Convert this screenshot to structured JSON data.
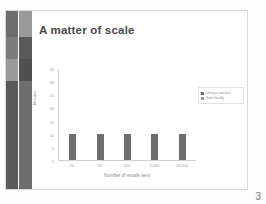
{
  "slide": {
    "title": "A matter of scale",
    "page_number": "3",
    "accent_bar_colors": [
      "#6e6e6e",
      "#7d7d7d",
      "#9a9a9a",
      "#5a5a5a",
      "#4f4f4f"
    ]
  },
  "chart_data": {
    "type": "bar",
    "title": "",
    "categories": [
      "20",
      "50",
      "100",
      "1,000",
      "10,000"
    ],
    "series": [
      {
        "name": "Using a service",
        "color": "#6d6d6d",
        "values": [
          10,
          10,
          10,
          10,
          10
        ]
      },
      {
        "name": "Sent locally",
        "color": "#9c9c9c",
        "values": [
          0,
          0,
          0,
          0,
          0
        ]
      }
    ],
    "xlabel": "Number of emails sent",
    "ylabel": "Minutes",
    "yticks": [
      "35",
      "30",
      "25",
      "20",
      "15",
      "10",
      "5",
      "0"
    ],
    "ylim": [
      0,
      35
    ],
    "grid": false,
    "legend_position": "right"
  }
}
